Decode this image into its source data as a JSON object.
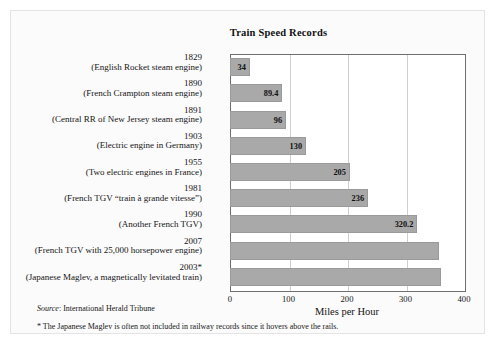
{
  "card": {
    "background": "#fbfbfb",
    "border_color": "#e4e4e4"
  },
  "footer": {
    "source_prefix": "Source",
    "source_separator": ": ",
    "source_text": "International Herald Tribune",
    "star_note": "* The Japanese Maglev is often not included in railway records since it hovers above the rails."
  },
  "chart_data": {
    "type": "bar",
    "orientation": "horizontal",
    "title": "Train Speed Records",
    "xlabel": "Miles per Hour",
    "ylabel": "",
    "xlim": [
      0,
      400
    ],
    "xticks": [
      0,
      100,
      200,
      300,
      400
    ],
    "xtick_labels": [
      "0",
      "100",
      "200",
      "300",
      "400"
    ],
    "grid": "vertical",
    "legend": "none",
    "bar_color": "#a9a9a9",
    "bar_border_color": "#9a9a9a",
    "categories": [
      "1829 (English Rocket steam engine)",
      "1890 (French Crampton steam engine)",
      "1891 (Central RR of New Jersey steam engine)",
      "1903 (Electric engine in Germany)",
      "1955 (Two electric engines in France)",
      "1981 (French TGV “train à grande vitesse”)",
      "1990 (Another French TGV)",
      "2007 (French TGV with 25,000 horsepower engine)",
      "2003* (Japanese Maglev, a magnetically levitated train)"
    ],
    "values": [
      34,
      89.4,
      96,
      130,
      205,
      236,
      320.2,
      357,
      361
    ],
    "bars": [
      {
        "year": "1829",
        "desc": "(English Rocket steam engine)",
        "value": 34,
        "value_label": "34"
      },
      {
        "year": "1890",
        "desc": "(French Crampton steam engine)",
        "value": 89.4,
        "value_label": "89.4"
      },
      {
        "year": "1891",
        "desc": "(Central RR of New Jersey steam engine)",
        "value": 96,
        "value_label": "96"
      },
      {
        "year": "1903",
        "desc": "(Electric engine in Germany)",
        "value": 130,
        "value_label": "130"
      },
      {
        "year": "1955",
        "desc": "(Two electric engines in France)",
        "value": 205,
        "value_label": "205"
      },
      {
        "year": "1981",
        "desc": "(French TGV “train à grande vitesse”)",
        "value": 236,
        "value_label": "236"
      },
      {
        "year": "1990",
        "desc": "(Another French TGV)",
        "value": 320.2,
        "value_label": "320.2"
      },
      {
        "year": "2007",
        "desc": "(French TGV with 25,000 horsepower engine)",
        "value": 357,
        "value_label": ""
      },
      {
        "year": "2003*",
        "desc": "(Japanese Maglev, a magnetically levitated train)",
        "value": 361,
        "value_label": ""
      }
    ]
  }
}
